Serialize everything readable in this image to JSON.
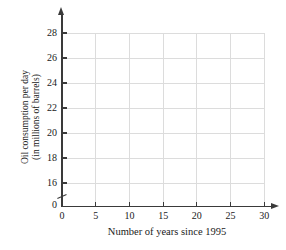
{
  "chart_data": {
    "type": "scatter",
    "title": "",
    "xlabel": "Number of years since 1995",
    "ylabel_lines": [
      "Oil consumption per day",
      "(in millions of barrels)"
    ],
    "x_ticks": [
      0,
      5,
      10,
      15,
      20,
      25,
      30
    ],
    "y_ticks": [
      0,
      16,
      18,
      20,
      22,
      24,
      26,
      28
    ],
    "xlim": [
      0,
      31.5
    ],
    "ylim": [
      0,
      29.5
    ],
    "y_axis_break_between": [
      0,
      16
    ],
    "grid": true,
    "legend": false,
    "series": [],
    "points": [],
    "colors": {
      "axis": "#3a3a3a",
      "grid": "#dcdcdc",
      "text": "#1a1a1a",
      "background": "#ffffff"
    }
  }
}
